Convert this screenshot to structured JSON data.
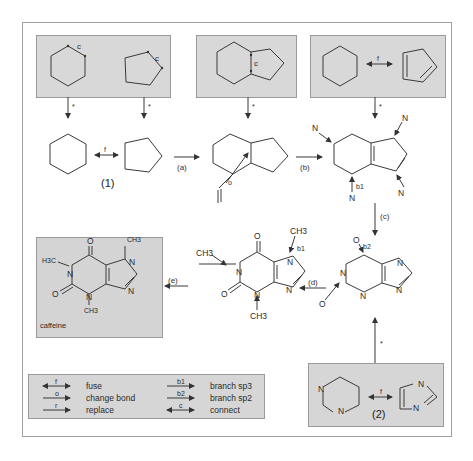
{
  "figure": {
    "type": "retrosynthetic skeleton-building diagram",
    "target_name": "caffeine",
    "colors": {
      "box_fill": "#d6d6d6",
      "frame": "#9a9a9a",
      "line": "#3a3a3a",
      "page": "#ffffff"
    }
  },
  "top_boxes": [
    {
      "id": "box-rings-connect",
      "arrow_label": "*",
      "mark": "c",
      "mark2": "c"
    },
    {
      "id": "box-bicycle-connect",
      "arrow_label": "*",
      "mark": "c"
    },
    {
      "id": "box-fuse-rings",
      "fuse_label": "f",
      "arrow_label": "*"
    }
  ],
  "row1": {
    "fuse_label": "f",
    "compound_label": "(1)",
    "step_a": "(a)",
    "step_b": "(b)",
    "change_bond_label": "o",
    "atoms": {
      "n1": "N",
      "n2": "N",
      "n3": "N",
      "n4": "N",
      "b1": "b1"
    }
  },
  "column_right": {
    "step_c": "(c)",
    "star": "*"
  },
  "row2": {
    "step_d": "(d)",
    "step_e": "(e)",
    "intermediate": {
      "o1": "O",
      "b2": "b2",
      "n1": "N",
      "n2": "N",
      "n3": "N",
      "n4": "N",
      "o2": "O"
    },
    "xanthine": {
      "ch3_top": "CH3",
      "b1": "b1",
      "ch3_left": "CH3",
      "o_top": "O",
      "n1": "N",
      "n3": "N",
      "n7": "N",
      "n9": "N",
      "o_bottom": "O",
      "ch3_bottom": "CH3"
    },
    "caffeine": {
      "label": "caffeine",
      "h3c": "H3C",
      "ch3_top": "CH3",
      "ch3_bottom": "CH3",
      "o_top": "O",
      "o_bottom": "O",
      "n1": "N",
      "n3": "N",
      "n7": "N",
      "n9": "N"
    }
  },
  "box2": {
    "fuse_label": "f",
    "compound_label": "(2)",
    "n1": "N",
    "n2": "N",
    "n3": "N",
    "n4": "N"
  },
  "legend": {
    "items": [
      {
        "symbol": "f",
        "text": "fuse"
      },
      {
        "symbol": "o",
        "text": "change bond"
      },
      {
        "symbol": "r",
        "text": "replace"
      },
      {
        "symbol": "b1",
        "text": "branch sp3"
      },
      {
        "symbol": "b2",
        "text": "branch sp2"
      },
      {
        "symbol": "c",
        "text": "connect"
      }
    ]
  }
}
